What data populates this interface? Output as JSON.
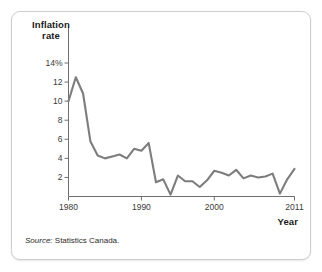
{
  "figure": {
    "source_prefix": "Source:",
    "source_text": "Statistics Canada."
  },
  "chart_data": {
    "type": "line",
    "title": "",
    "ylabel": "Inflation\nrate",
    "xlabel": "Year",
    "grid": false,
    "legend": "none",
    "xlim": [
      1980,
      2011
    ],
    "ylim": [
      0,
      14
    ],
    "xticks": [
      1980,
      1990,
      2000,
      2011
    ],
    "xtick_labels": [
      "1980",
      "1990",
      "2000",
      "2011"
    ],
    "yticks": [
      2,
      4,
      6,
      8,
      10,
      12,
      14
    ],
    "ytick_labels": [
      "2",
      "4",
      "6",
      "8",
      "10",
      "12",
      "14%"
    ],
    "line_color": "#7d7d7d",
    "series": [
      {
        "name": "Inflation rate",
        "x": [
          1980,
          1981,
          1982,
          1983,
          1984,
          1985,
          1986,
          1987,
          1988,
          1989,
          1990,
          1991,
          1992,
          1993,
          1994,
          1995,
          1996,
          1997,
          1998,
          1999,
          2000,
          2001,
          2002,
          2003,
          2004,
          2005,
          2006,
          2007,
          2008,
          2009,
          2010,
          2011
        ],
        "values": [
          10.0,
          12.5,
          10.8,
          5.8,
          4.3,
          4.0,
          4.2,
          4.4,
          4.0,
          5.0,
          4.8,
          5.6,
          1.5,
          1.8,
          0.2,
          2.2,
          1.6,
          1.6,
          1.0,
          1.7,
          2.7,
          2.5,
          2.2,
          2.8,
          1.9,
          2.2,
          2.0,
          2.1,
          2.4,
          0.3,
          1.8,
          2.9
        ]
      }
    ]
  }
}
